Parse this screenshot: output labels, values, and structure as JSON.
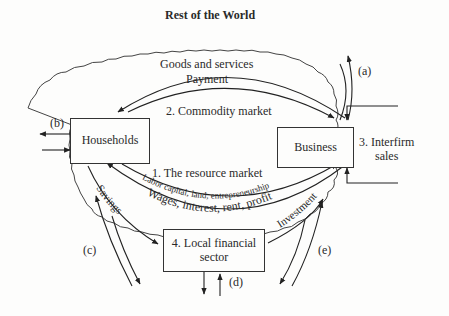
{
  "title": "Rest of the World",
  "nodes": {
    "households": "Households",
    "business": "Business",
    "financial": [
      "4. Local financial",
      "sector"
    ],
    "interfirm": [
      "3. Interfirm",
      "sales"
    ]
  },
  "flows": {
    "goods": "Goods and services",
    "payment": "Payment",
    "commodity_market": "2. Commodity market",
    "resource_market": "1. The resource market",
    "factors": "Labor capital, land, entrepreneurship",
    "income": "Wages, interest, rent, profit",
    "savings": "Savings",
    "investment": "Investment"
  },
  "leakages": {
    "a": "(a)",
    "b": "(b)",
    "c": "(c)",
    "d": "(d)",
    "e": "(e)"
  }
}
